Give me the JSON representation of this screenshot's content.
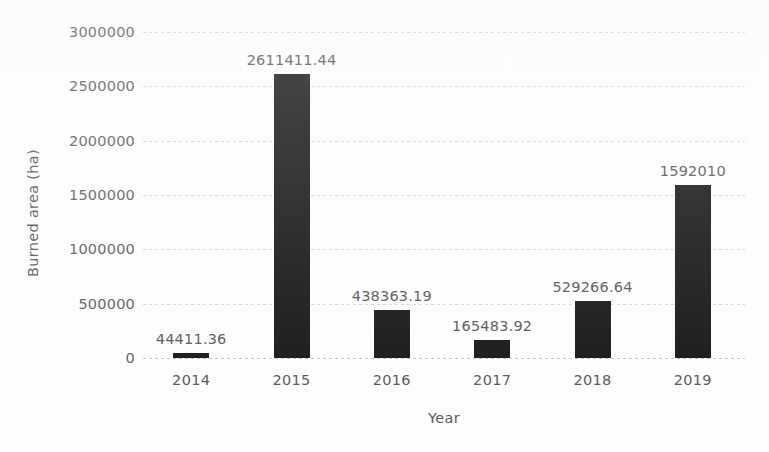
{
  "chart_data": {
    "type": "bar",
    "title": "",
    "xlabel": "Year",
    "ylabel": "Burned area (ha)",
    "categories": [
      "2014",
      "2015",
      "2016",
      "2017",
      "2018",
      "2019"
    ],
    "values": [
      44411.36,
      2611411.44,
      438363.19,
      165483.92,
      529266.64,
      1592010
    ],
    "value_labels": [
      "44411.36",
      "2611411.44",
      "438363.19",
      "165483.92",
      "529266.64",
      "1592010"
    ],
    "ylim": [
      0,
      3000000
    ],
    "y_ticks": [
      0,
      500000,
      1000000,
      1500000,
      2000000,
      2500000,
      3000000
    ],
    "y_tick_labels": [
      "0",
      "500000",
      "1000000",
      "1500000",
      "2000000",
      "2500000",
      "3000000"
    ],
    "grid": true,
    "grid_axis": "y",
    "legend": false,
    "bar_color": "#141414",
    "text_color": "#555555",
    "gridline_color": "#a0a0a0",
    "background_color": "#ffffff"
  }
}
